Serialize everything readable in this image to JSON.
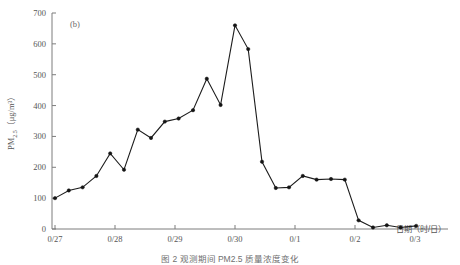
{
  "figure": {
    "panel_tag": "(b)",
    "caption": "图 2  观测期间 PM2.5 质量浓度变化"
  },
  "chart_data": {
    "type": "line",
    "title": "",
    "panel_label": "(b)",
    "xlabel": "日期（时/日）",
    "ylabel": "PM2.5（μg/m³）",
    "ylabel_parts": {
      "species": "PM",
      "subscript": "2.5",
      "unit": "（μg/m³）"
    },
    "grid": false,
    "legend": "none",
    "marker": "filled-circle",
    "line_color": "#141414",
    "ylim": [
      0,
      700
    ],
    "yticks": [
      0,
      100,
      200,
      300,
      400,
      500,
      600,
      700
    ],
    "ytick_labels": [
      "0",
      "100",
      "200",
      "300",
      "400",
      "500",
      "600",
      "700"
    ],
    "xtick_labels": [
      "0/27",
      "0/28",
      "0/29",
      "0/30",
      "0/1",
      "0/2",
      "0/3"
    ],
    "xtick_positions_days": [
      0,
      1,
      2,
      3,
      4,
      5,
      6
    ],
    "xlim_days": [
      -0.05,
      6.55
    ],
    "x": [
      0.0,
      0.23,
      0.46,
      0.69,
      0.92,
      1.15,
      1.38,
      1.6,
      1.83,
      2.06,
      2.3,
      2.53,
      2.76,
      3.0,
      3.22,
      3.45,
      3.68,
      3.9,
      4.13,
      4.36,
      4.6,
      4.83,
      5.06,
      5.3,
      5.53,
      5.76,
      6.02
    ],
    "values": [
      100,
      125,
      135,
      172,
      245,
      192,
      322,
      295,
      348,
      358,
      385,
      487,
      402,
      660,
      583,
      218,
      133,
      135,
      172,
      160,
      162,
      160,
      28,
      5,
      12,
      5,
      10
    ],
    "units": "μg/m³",
    "n_points": 27,
    "peak_value": 660,
    "min_value": 5
  }
}
